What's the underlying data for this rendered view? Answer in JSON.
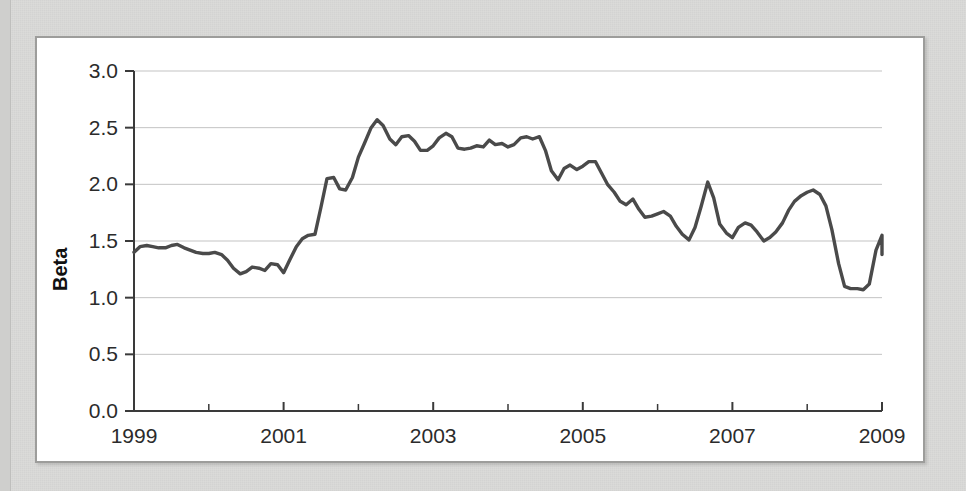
{
  "figure": {
    "background_color": "#d9d9d7",
    "panel_color": "#ffffff",
    "panel_border_color": "#9d9d9b",
    "line_color": "#4a4a4a",
    "grid_color": "#c3c3c3"
  },
  "chart_data": {
    "type": "line",
    "title": "",
    "subtitle": "",
    "xlabel": "",
    "ylabel": "Beta",
    "xlim": [
      1999,
      2009
    ],
    "ylim": [
      0.0,
      3.0
    ],
    "grid": true,
    "legend": null,
    "y_ticks": [
      "0.0",
      "0.5",
      "1.0",
      "1.5",
      "2.0",
      "2.5",
      "3.0"
    ],
    "y_tick_values": [
      0.0,
      0.5,
      1.0,
      1.5,
      2.0,
      2.5,
      3.0
    ],
    "x_ticks": [
      "1999",
      "2001",
      "2003",
      "2005",
      "2007",
      "2009"
    ],
    "x_tick_values": [
      1999,
      2001,
      2003,
      2005,
      2007,
      2009
    ],
    "x_minor_tick_values": [
      2000,
      2002,
      2004,
      2006,
      2008
    ],
    "series": [
      {
        "name": "Beta",
        "color": "#4a4a4a",
        "x": [
          1999.0,
          1999.08,
          1999.17,
          1999.25,
          1999.33,
          1999.42,
          1999.5,
          1999.58,
          1999.67,
          1999.75,
          1999.83,
          1999.92,
          2000.0,
          2000.08,
          2000.17,
          2000.25,
          2000.33,
          2000.42,
          2000.5,
          2000.58,
          2000.67,
          2000.75,
          2000.83,
          2000.92,
          2001.0,
          2001.08,
          2001.17,
          2001.25,
          2001.33,
          2001.42,
          2001.5,
          2001.58,
          2001.67,
          2001.75,
          2001.83,
          2001.92,
          2002.0,
          2002.08,
          2002.17,
          2002.25,
          2002.33,
          2002.42,
          2002.5,
          2002.58,
          2002.67,
          2002.75,
          2002.83,
          2002.92,
          2003.0,
          2003.08,
          2003.17,
          2003.25,
          2003.33,
          2003.42,
          2003.5,
          2003.58,
          2003.67,
          2003.75,
          2003.83,
          2003.92,
          2004.0,
          2004.08,
          2004.17,
          2004.25,
          2004.33,
          2004.42,
          2004.5,
          2004.58,
          2004.67,
          2004.75,
          2004.83,
          2004.92,
          2005.0,
          2005.08,
          2005.17,
          2005.25,
          2005.33,
          2005.42,
          2005.5,
          2005.58,
          2005.67,
          2005.75,
          2005.83,
          2005.92,
          2006.0,
          2006.08,
          2006.17,
          2006.25,
          2006.33,
          2006.42,
          2006.5,
          2006.58,
          2006.67,
          2006.75,
          2006.83,
          2006.92,
          2007.0,
          2007.08,
          2007.17,
          2007.25,
          2007.33,
          2007.42,
          2007.5,
          2007.58,
          2007.67,
          2007.75,
          2007.83,
          2007.92,
          2008.0,
          2008.08,
          2008.17,
          2008.25,
          2008.33,
          2008.42,
          2008.5,
          2008.58,
          2008.67,
          2008.75,
          2008.83,
          2008.92,
          2009.0
        ],
        "values": [
          1.4,
          1.45,
          1.46,
          1.45,
          1.44,
          1.44,
          1.46,
          1.47,
          1.44,
          1.42,
          1.4,
          1.39,
          1.39,
          1.4,
          1.38,
          1.33,
          1.26,
          1.21,
          1.23,
          1.27,
          1.26,
          1.24,
          1.3,
          1.29,
          1.22,
          1.33,
          1.45,
          1.52,
          1.55,
          1.56,
          1.8,
          2.05,
          2.06,
          1.96,
          1.95,
          2.06,
          2.24,
          2.36,
          2.5,
          2.57,
          2.52,
          2.4,
          2.35,
          2.42,
          2.43,
          2.38,
          2.3,
          2.3,
          2.34,
          2.41,
          2.45,
          2.42,
          2.32,
          2.31,
          2.32,
          2.34,
          2.33,
          2.39,
          2.35,
          2.36,
          2.33,
          2.35,
          2.41,
          2.42,
          2.4,
          2.42,
          2.3,
          2.12,
          2.04,
          2.14,
          2.17,
          2.13,
          2.16,
          2.2,
          2.2,
          2.1,
          2.0,
          1.93,
          1.85,
          1.82,
          1.87,
          1.78,
          1.71,
          1.72,
          1.74,
          1.76,
          1.72,
          1.63,
          1.56,
          1.51,
          1.62,
          1.8,
          2.02,
          1.88,
          1.65,
          1.57,
          1.53,
          1.62,
          1.66,
          1.64,
          1.58,
          1.5,
          1.53,
          1.58,
          1.66,
          1.77,
          1.85,
          1.9,
          1.93,
          1.95,
          1.91,
          1.81,
          1.6,
          1.3,
          1.1,
          1.08,
          1.08,
          1.07,
          1.12,
          1.42,
          1.55
        ]
      }
    ],
    "series_tail": {
      "x": [
        2009.0,
        2009.05,
        2009.1,
        2009.16,
        2009.22,
        2009.28,
        2009.34,
        2009.4,
        2009.46,
        2009.52,
        2009.58,
        2009.64,
        2009.7,
        2009.76,
        2009.82,
        2009.88,
        2009.94,
        2010.0
      ],
      "values": [
        1.55,
        1.52,
        1.47,
        1.46,
        1.5,
        1.54,
        1.53,
        1.47,
        1.42,
        1.46,
        1.53,
        1.55,
        1.51,
        1.44,
        1.39,
        1.38,
        1.39,
        1.39
      ]
    },
    "annotations": [],
    "notable_points": {
      "start": {
        "x": 1999.0,
        "y": 1.4
      },
      "peak": {
        "x": 2002.25,
        "y": 2.57
      },
      "trough_2000": {
        "x": 2000.42,
        "y": 1.21
      },
      "spike_2006": {
        "x": 2006.67,
        "y": 2.02
      },
      "crash_2008": {
        "x": 2008.58,
        "y": 1.07
      },
      "end": {
        "x": 2009.0,
        "y": 1.39
      }
    }
  }
}
